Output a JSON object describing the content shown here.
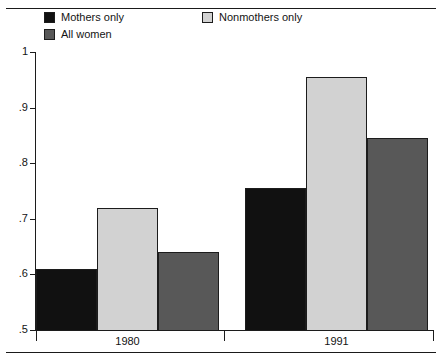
{
  "figure": {
    "clipped_caption_top": "",
    "legend": [
      {
        "label": "Mothers only",
        "color": "#111111",
        "swatch": "legend-swatch-mothers"
      },
      {
        "label": "Nonmothers only",
        "color": "#d2d2d2",
        "swatch": "legend-swatch-nonmothers"
      },
      {
        "label": "All women",
        "color": "#585858",
        "swatch": "legend-swatch-allwomen"
      }
    ]
  },
  "chart_data": {
    "type": "bar",
    "title": "",
    "xlabel": "",
    "ylabel": "",
    "categories": [
      "1980",
      "1991"
    ],
    "series": [
      {
        "name": "Mothers only",
        "color": "#111111",
        "values": [
          0.61,
          0.755
        ]
      },
      {
        "name": "Nonmothers only",
        "color": "#d2d2d2",
        "values": [
          0.72,
          0.955
        ]
      },
      {
        "name": "All women",
        "color": "#585858",
        "values": [
          0.64,
          0.845
        ]
      }
    ],
    "ylim": [
      0.5,
      1.0
    ],
    "yticks": [
      1,
      0.9,
      0.8,
      0.7,
      0.6,
      0.5
    ],
    "ytick_labels": [
      "1",
      ".9",
      ".8",
      ".7",
      ".6",
      ".5"
    ],
    "grid": false,
    "legend_position": "top-left"
  }
}
